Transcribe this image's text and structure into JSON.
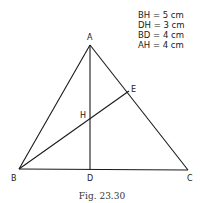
{
  "figure": {
    "caption": "Fig. 23.30",
    "given": [
      "BH = 5 cm",
      "DH = 3 cm",
      "BD = 4 cm",
      "AH = 4 cm"
    ],
    "points": {
      "A": {
        "label": "A",
        "x": 90,
        "y": 45
      },
      "B": {
        "label": "B",
        "x": 19,
        "y": 169
      },
      "C": {
        "label": "C",
        "x": 188,
        "y": 170
      },
      "D": {
        "label": "D",
        "x": 90,
        "y": 170
      },
      "E": {
        "label": "E",
        "x": 129,
        "y": 91
      },
      "H": {
        "label": "H",
        "x": 90,
        "y": 118
      }
    },
    "segments": [
      "AB",
      "AC",
      "BC",
      "AD",
      "BE"
    ],
    "line_color": "#1a1a1a"
  }
}
